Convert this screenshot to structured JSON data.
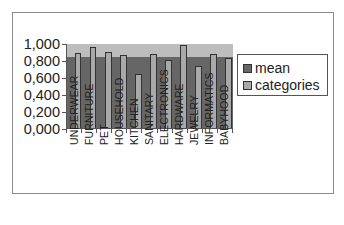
{
  "chart_data": {
    "type": "bar",
    "title": "",
    "xlabel": "",
    "ylabel": "",
    "ylim": [
      0,
      1
    ],
    "yticks": [
      "1,000",
      "0,800",
      "0,600",
      "0,400",
      "0,200",
      "0,000"
    ],
    "categories": [
      "UNDERWEAR",
      "FURNITURE",
      "PET",
      "HOUSEHOLD",
      "KITCHEN",
      "SANITARY",
      "ELECTRONICS",
      "HARDWARE",
      "JEWELRY",
      "INFORMATICS",
      "BABYHOOD"
    ],
    "series": [
      {
        "name": "mean",
        "color": "#666666",
        "values": [
          0.84,
          0.84,
          0.84,
          0.84,
          0.84,
          0.84,
          0.84,
          0.84,
          0.84,
          0.84,
          0.84
        ]
      },
      {
        "name": "categories",
        "color": "#a9a9a9",
        "values": [
          0.88,
          0.95,
          0.89,
          0.86,
          0.63,
          0.87,
          0.8,
          0.98,
          0.73,
          0.87,
          0.82
        ]
      }
    ],
    "grid": false,
    "legend_position": "right",
    "plot_background": "#bdbdbd"
  },
  "legend": {
    "items": [
      {
        "label": "mean",
        "color": "#666666"
      },
      {
        "label": "categories",
        "color": "#a9a9a9"
      }
    ]
  }
}
